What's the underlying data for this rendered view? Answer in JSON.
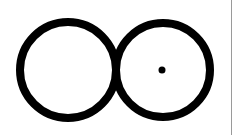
{
  "diagram": {
    "type": "symbol",
    "colors": {
      "background": "#ffffff",
      "stroke": "#000000",
      "edge_line": "#9a9a9a"
    },
    "stroke_width": 8,
    "shapes": [
      {
        "id": "left-circle",
        "kind": "circle",
        "cx": 68,
        "cy": 70,
        "r": 48,
        "filled": false
      },
      {
        "id": "right-circle",
        "kind": "circle",
        "cx": 163,
        "cy": 70,
        "r": 47,
        "filled": false
      },
      {
        "id": "center-dot",
        "kind": "dot",
        "cx": 162,
        "cy": 70,
        "r": 3.5,
        "filled": true
      }
    ]
  }
}
